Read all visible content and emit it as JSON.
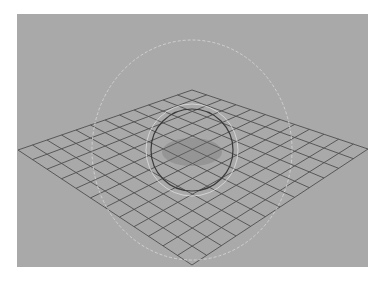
{
  "viewport": {
    "name": "3D viewport",
    "background": "#a9a9a9",
    "rect": {
      "x": 17,
      "y": 14,
      "w": 351,
      "h": 253
    }
  },
  "grid": {
    "divisions": 12,
    "line_color": "#4e4e4e",
    "corners": {
      "top": [
        192,
        90
      ],
      "right": [
        368,
        149
      ],
      "bottom": [
        192,
        265
      ],
      "left": [
        18,
        150
      ]
    }
  },
  "manipulator": {
    "type": "rotate",
    "center": [
      192,
      150
    ],
    "sphere_radius": 41,
    "sphere_color": "#3a3a3a",
    "inner_ring_radius": 46,
    "inner_ring_color": "#e6e6e6",
    "outer_ring": {
      "cx": 192,
      "cy": 150,
      "rx": 100,
      "ry": 110,
      "color": "#d8d8d8"
    },
    "center_shade_color": "#6f6f6f"
  }
}
